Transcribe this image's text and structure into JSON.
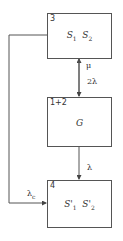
{
  "diagram": {
    "states": [
      {
        "id": "3",
        "content": {
          "a": "S",
          "a_sub": "1",
          "b": "S",
          "b_sub": "2"
        }
      },
      {
        "id": "1+2",
        "content": {
          "text": "G"
        }
      },
      {
        "id": "4",
        "content": {
          "a": "S'",
          "a_sub": "1",
          "b": "S'",
          "b_sub": "2"
        }
      }
    ],
    "transitions": [
      {
        "from": "1+2",
        "to": "3",
        "label": "μ"
      },
      {
        "from": "3",
        "to": "1+2",
        "label": "2λ"
      },
      {
        "from": "1+2",
        "to": "4",
        "label": "λ"
      },
      {
        "from": "3",
        "to": "4",
        "label": "λ",
        "label_sub": "c"
      }
    ]
  }
}
